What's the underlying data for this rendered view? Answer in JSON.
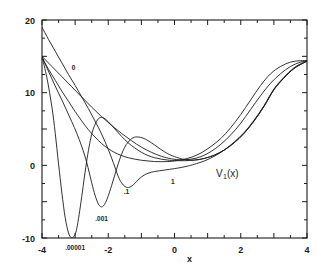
{
  "figure": {
    "name": "isospectral-potential-family-plot",
    "function_label": "V",
    "function_sub": "1",
    "function_arg": "(x)"
  },
  "axes": {
    "x_label": "x",
    "y_label": "",
    "x_ticks": [
      "-4",
      "-2",
      "0",
      "2",
      "4"
    ],
    "y_ticks": [
      "-10",
      "0",
      "10",
      "20"
    ],
    "x_min": -4,
    "x_max": 4,
    "y_min": -10,
    "y_max": 20,
    "frame_color": "#1b1b1b"
  },
  "chart_data": {
    "type": "line",
    "title": "",
    "subtitle": "",
    "xlabel": "x",
    "ylabel": "V₁(x)",
    "xlim": [
      -4,
      4
    ],
    "ylim": [
      -10,
      20
    ],
    "grid": false,
    "legend_position": "inline-curve-labels",
    "annotations": [
      {
        "text": "0",
        "x": -3.05,
        "y": 13.1
      },
      {
        "text": ".00001",
        "x": -3.0,
        "y": -11.6
      },
      {
        "text": ".001",
        "x": -2.2,
        "y": -7.6
      },
      {
        "text": ".1",
        "x": -1.45,
        "y": -3.9
      },
      {
        "text": "1",
        "x": -0.05,
        "y": -2.6
      },
      {
        "text": "V₁(x)",
        "x": 1.25,
        "y": -1.6
      }
    ],
    "series": [
      {
        "name": "0",
        "label": ".00001",
        "x": [
          -4.0,
          -3.85,
          -3.7,
          -3.6,
          -3.5,
          -3.4,
          -3.3,
          -3.2,
          -3.12,
          -3.05,
          -3.0,
          -2.95,
          -2.88,
          -2.8,
          -2.72,
          -2.64,
          -2.56,
          -2.48,
          -2.4,
          -2.3,
          -2.2,
          -2.1,
          -2.0,
          -1.8,
          -1.6,
          -1.4,
          -1.2,
          -1.0,
          -0.8,
          -0.6,
          -0.4,
          -0.2,
          0.0,
          0.3,
          0.6,
          0.9,
          1.2,
          1.5,
          1.8,
          2.1,
          2.4,
          2.7,
          3.0,
          3.3,
          3.6,
          3.9,
          4.0
        ],
        "y": [
          15.0,
          12.0,
          8.0,
          4.4,
          0.2,
          -3.8,
          -7.2,
          -9.3,
          -9.95,
          -9.85,
          -9.5,
          -8.7,
          -6.8,
          -4.3,
          -1.6,
          0.9,
          3.0,
          4.6,
          5.6,
          6.4,
          6.6,
          6.4,
          6.0,
          5.0,
          4.0,
          3.1,
          2.4,
          1.8,
          1.35,
          1.05,
          0.85,
          0.72,
          0.66,
          0.64,
          0.72,
          0.95,
          1.4,
          2.1,
          3.1,
          4.4,
          6.1,
          8.1,
          10.4,
          12.0,
          13.3,
          14.1,
          14.3
        ]
      },
      {
        "name": "1",
        "label": ".001",
        "x": [
          -4.0,
          -3.85,
          -3.7,
          -3.55,
          -3.4,
          -3.25,
          -3.1,
          -2.95,
          -2.8,
          -2.65,
          -2.5,
          -2.4,
          -2.3,
          -2.22,
          -2.15,
          -2.08,
          -2.0,
          -1.9,
          -1.8,
          -1.7,
          -1.6,
          -1.5,
          -1.4,
          -1.25,
          -1.1,
          -0.95,
          -0.8,
          -0.6,
          -0.4,
          -0.2,
          0.0,
          0.3,
          0.6,
          0.9,
          1.2,
          1.5,
          1.8,
          2.1,
          2.4,
          2.7,
          3.0,
          3.3,
          3.6,
          3.9,
          4.0
        ],
        "y": [
          15.0,
          13.4,
          11.9,
          10.4,
          9.0,
          7.5,
          6.0,
          4.4,
          2.6,
          0.4,
          -2.4,
          -4.1,
          -5.3,
          -5.7,
          -5.6,
          -5.1,
          -4.2,
          -2.8,
          -1.3,
          0.2,
          1.5,
          2.5,
          3.2,
          3.8,
          3.9,
          3.75,
          3.4,
          2.8,
          2.15,
          1.6,
          1.2,
          0.8,
          0.72,
          0.95,
          1.4,
          2.1,
          3.1,
          4.4,
          6.1,
          8.1,
          10.4,
          12.0,
          13.3,
          14.1,
          14.3
        ]
      },
      {
        "name": "2",
        "label": ".1",
        "x": [
          -4.0,
          -3.8,
          -3.6,
          -3.4,
          -3.2,
          -3.0,
          -2.8,
          -2.6,
          -2.4,
          -2.2,
          -2.0,
          -1.85,
          -1.7,
          -1.6,
          -1.5,
          -1.42,
          -1.35,
          -1.28,
          -1.2,
          -1.1,
          -1.0,
          -0.9,
          -0.8,
          -0.7,
          -0.6,
          -0.45,
          -0.3,
          -0.15,
          0.0,
          0.2,
          0.4,
          0.6,
          0.9,
          1.2,
          1.5,
          1.8,
          2.1,
          2.4,
          2.7,
          3.0,
          3.3,
          3.6,
          3.9,
          4.0
        ],
        "y": [
          19.0,
          17.3,
          15.7,
          14.1,
          12.5,
          11.0,
          9.4,
          7.8,
          6.1,
          4.3,
          2.2,
          0.4,
          -1.5,
          -2.4,
          -2.9,
          -3.05,
          -3.0,
          -2.8,
          -2.5,
          -2.0,
          -1.6,
          -1.3,
          -1.1,
          -0.95,
          -0.85,
          -0.75,
          -0.65,
          -0.55,
          -0.45,
          -0.3,
          -0.1,
          0.15,
          0.6,
          1.25,
          2.1,
          3.2,
          4.5,
          6.2,
          8.2,
          10.5,
          12.1,
          13.4,
          14.2,
          14.4
        ]
      },
      {
        "name": "3",
        "label": "1",
        "x": [
          -4.0,
          -3.8,
          -3.6,
          -3.4,
          -3.2,
          -3.0,
          -2.8,
          -2.6,
          -2.4,
          -2.2,
          -2.0,
          -1.8,
          -1.6,
          -1.4,
          -1.2,
          -1.0,
          -0.8,
          -0.6,
          -0.4,
          -0.2,
          0.0,
          0.25,
          0.5,
          0.8,
          1.1,
          1.4,
          1.7,
          2.0,
          2.3,
          2.6,
          2.9,
          3.2,
          3.5,
          3.8,
          4.0
        ],
        "y": [
          14.8,
          13.2,
          11.7,
          10.2,
          8.8,
          7.4,
          6.1,
          4.9,
          3.9,
          3.0,
          2.3,
          1.75,
          1.35,
          1.05,
          0.85,
          0.7,
          0.6,
          0.52,
          0.5,
          0.52,
          0.6,
          0.8,
          1.1,
          1.7,
          2.6,
          3.7,
          5.2,
          7.0,
          9.0,
          11.0,
          12.6,
          13.6,
          14.2,
          14.4,
          14.4
        ]
      },
      {
        "name": "4",
        "label": "0",
        "x": [
          -4.0,
          -3.7,
          -3.4,
          -3.1,
          -2.8,
          -2.5,
          -2.2,
          -1.9,
          -1.6,
          -1.3,
          -1.0,
          -0.7,
          -0.4,
          -0.1,
          0.2,
          0.5,
          0.8,
          1.1,
          1.4,
          1.7,
          2.0,
          2.3,
          2.6,
          2.9,
          3.2,
          3.5,
          3.8,
          4.0
        ],
        "y": [
          15.0,
          13.6,
          12.2,
          10.8,
          9.4,
          8.0,
          6.7,
          5.5,
          4.4,
          3.4,
          2.5,
          1.8,
          1.25,
          0.9,
          0.75,
          0.85,
          1.2,
          1.9,
          2.9,
          4.2,
          5.8,
          7.7,
          9.6,
          11.3,
          12.6,
          13.6,
          14.2,
          14.4
        ]
      }
    ]
  }
}
